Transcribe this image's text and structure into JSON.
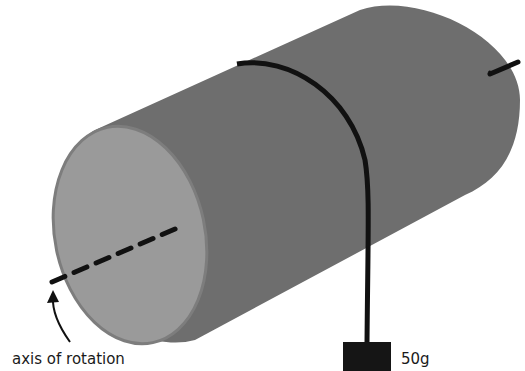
{
  "diagram": {
    "type": "physics-illustration",
    "labels": {
      "axis": "axis of rotation",
      "mass": "50g"
    },
    "colors": {
      "background": "#ffffff",
      "cylinder_body": "#6e6e6e",
      "cylinder_face": "#9a9a9a",
      "face_rim": "#7d7d7d",
      "string": "#111111",
      "mass": "#151515",
      "axis_line": "#111111"
    },
    "icons": [
      "curved-arrow-icon"
    ]
  }
}
